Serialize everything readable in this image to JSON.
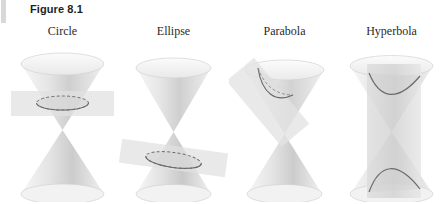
{
  "figure": {
    "caption": "Figure 8.1",
    "background_color": "#ffffff",
    "caption_color": "#231f20",
    "label_color": "#2a2a2a",
    "edge_mark_color": "#d8d8d8"
  },
  "panels": [
    {
      "id": "circle",
      "label": "Circle",
      "conic": "circle",
      "nappes_shown": 2,
      "cut_nappe": "upper",
      "plane_orientation": "horizontal",
      "plane_tilt_degrees": 0,
      "curve_description": "closed circular section across upper nappe"
    },
    {
      "id": "ellipse",
      "label": "Ellipse",
      "conic": "ellipse",
      "nappes_shown": 2,
      "cut_nappe": "lower",
      "plane_orientation": "oblique",
      "plane_tilt_degrees": 8,
      "curve_description": "closed oblique section across lower nappe"
    },
    {
      "id": "parabola",
      "label": "Parabola",
      "conic": "parabola",
      "nappes_shown": 2,
      "cut_nappe": "upper",
      "plane_orientation": "parallel-to-generator",
      "plane_tilt_degrees": -40,
      "curve_description": "open single-branch section parallel to a slant edge"
    },
    {
      "id": "hyperbola",
      "label": "Hyperbola",
      "conic": "hyperbola",
      "nappes_shown": 2,
      "cut_nappe": "both",
      "plane_orientation": "vertical",
      "plane_tilt_degrees": 90,
      "curve_description": "two open branches cutting both nappes"
    }
  ],
  "palette": {
    "cone_light": "#f4f4f4",
    "cone_mid": "#dedede",
    "cone_dark": "#bdbdbd",
    "plane_fill": "#e2e2e2",
    "curve_stroke": "#6e6e6e",
    "outline": "#c9c9c9"
  }
}
